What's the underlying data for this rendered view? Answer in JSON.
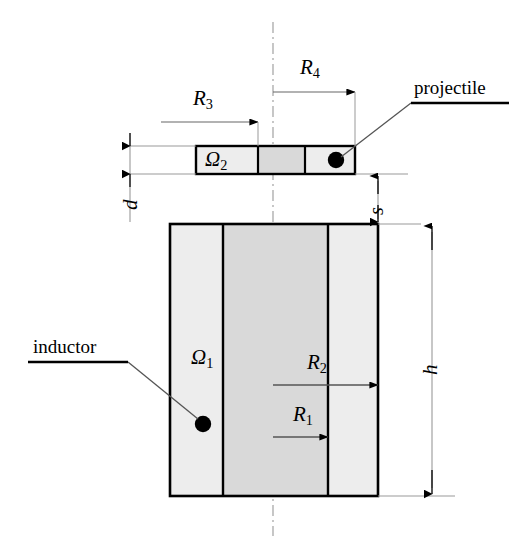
{
  "figure": {
    "background_color": "#ffffff",
    "line_color": "#000000",
    "thin_line_color": "#888888",
    "band_light_fill": "#ededed",
    "band_dark_fill": "#d9d9d9"
  },
  "callouts": {
    "projectile_label": "projectile",
    "inductor_label": "inductor"
  },
  "regions": {
    "projectile_domain": "Ω",
    "projectile_domain_sub": "2",
    "inductor_domain": "Ω",
    "inductor_domain_sub": "1"
  },
  "dimensions": [
    {
      "name": "R3",
      "symbol": "R",
      "sub": "3",
      "description": "projectile inner radius"
    },
    {
      "name": "R4",
      "symbol": "R",
      "sub": "4",
      "description": "projectile outer radius"
    },
    {
      "name": "R1",
      "symbol": "R",
      "sub": "1",
      "description": "inductor inner radius"
    },
    {
      "name": "R2",
      "symbol": "R",
      "sub": "2",
      "description": "inductor outer radius"
    },
    {
      "name": "d",
      "symbol": "d",
      "sub": "",
      "description": "projectile thickness"
    },
    {
      "name": "s",
      "symbol": "s",
      "sub": "",
      "description": "gap between projectile and inductor"
    },
    {
      "name": "h",
      "symbol": "h",
      "sub": "",
      "description": "inductor height"
    }
  ],
  "labels": {
    "R3": "R",
    "R3_sub": "3",
    "R4": "R",
    "R4_sub": "4",
    "R1": "R",
    "R1_sub": "1",
    "R2": "R",
    "R2_sub": "2",
    "d": "d",
    "s": "s",
    "h": "h"
  }
}
